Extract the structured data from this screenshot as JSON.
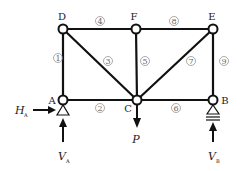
{
  "diagram": {
    "type": "truss",
    "nodes": [
      {
        "id": "D",
        "label": "D",
        "x": 63,
        "y": 29
      },
      {
        "id": "F",
        "label": "F",
        "x": 136,
        "y": 29
      },
      {
        "id": "E",
        "label": "E",
        "x": 213,
        "y": 29
      },
      {
        "id": "A",
        "label": "A",
        "x": 63,
        "y": 100
      },
      {
        "id": "C",
        "label": "C",
        "x": 137,
        "y": 100
      },
      {
        "id": "B",
        "label": "B",
        "x": 213,
        "y": 100
      }
    ],
    "members": [
      {
        "number": "1",
        "from": "A",
        "to": "D"
      },
      {
        "number": "2",
        "from": "A",
        "to": "C"
      },
      {
        "number": "3",
        "from": "D",
        "to": "C"
      },
      {
        "number": "4",
        "from": "D",
        "to": "F"
      },
      {
        "number": "5",
        "from": "F",
        "to": "C"
      },
      {
        "number": "6",
        "from": "C",
        "to": "B"
      },
      {
        "number": "7",
        "from": "C",
        "to": "E"
      },
      {
        "number": "8",
        "from": "F",
        "to": "E"
      },
      {
        "number": "9",
        "from": "E",
        "to": "B"
      }
    ],
    "supports": [
      {
        "node": "A",
        "type": "pin"
      },
      {
        "node": "B",
        "type": "roller"
      }
    ],
    "forces": {
      "load": {
        "symbol": "P",
        "node": "C",
        "direction": "down"
      },
      "ha": {
        "symbol": "H",
        "subscript": "A",
        "direction": "right"
      },
      "va": {
        "symbol": "V",
        "subscript": "A",
        "direction": "up"
      },
      "vb": {
        "symbol": "V",
        "subscript": "B",
        "direction": "up"
      }
    }
  }
}
